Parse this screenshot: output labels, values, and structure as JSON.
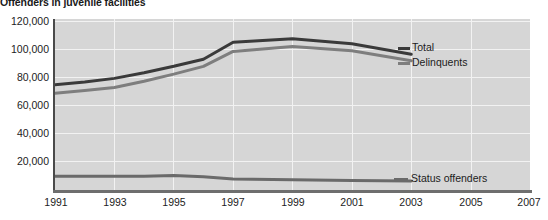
{
  "chart": {
    "title": "Offenders in juvenile facilities"
  },
  "axes": {
    "y_ticks": [
      "120,000",
      "100,000",
      "80,000",
      "60,000",
      "40,000",
      "20,000"
    ],
    "x_ticks": [
      "1991",
      "1993",
      "1995",
      "1997",
      "1999",
      "2001",
      "2003",
      "2005",
      "2007"
    ]
  },
  "legend": {
    "total": "Total",
    "delinquents": "Delinquents",
    "status_offenders": "Status offenders"
  },
  "colors": {
    "total_line": "#3a3a3a",
    "delinquents_line": "#7e7e7e",
    "status_line": "#6a6a6a",
    "plot_background": "#d6d6d6",
    "gridline": "#f2f2f2",
    "axis": "#4a4a4a",
    "text": "#1c1c1c"
  },
  "chart_data": {
    "type": "line",
    "title": "Offenders in juvenile facilities",
    "xlabel": "",
    "ylabel": "",
    "xlim": [
      1991,
      2007
    ],
    "ylim": [
      0,
      120000
    ],
    "grid": true,
    "legend_position": "right-inline",
    "x": [
      1991,
      1992,
      1993,
      1994,
      1995,
      1996,
      1997,
      1999,
      2001,
      2003
    ],
    "series": [
      {
        "name": "Total",
        "color": "#3a3a3a",
        "values": [
          75000,
          77000,
          79500,
          83500,
          88000,
          93000,
          105000,
          107500,
          104000,
          96500
        ]
      },
      {
        "name": "Delinquents",
        "color": "#7e7e7e",
        "values": [
          69000,
          71000,
          73000,
          77500,
          82500,
          88000,
          98500,
          102000,
          99000,
          92000
        ]
      },
      {
        "name": "Status offenders",
        "color": "#6a6a6a",
        "values": [
          10500,
          10500,
          10500,
          10500,
          11000,
          10000,
          8500,
          8000,
          7500,
          7000
        ]
      }
    ]
  }
}
